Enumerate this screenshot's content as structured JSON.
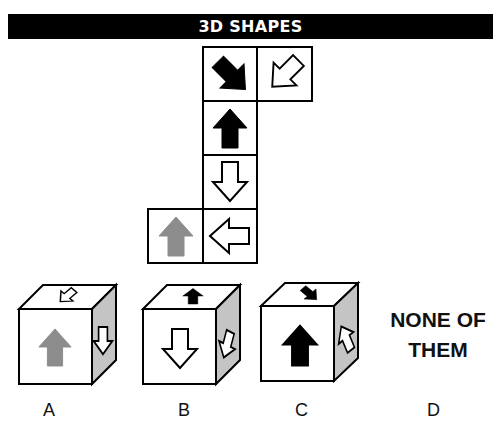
{
  "header": {
    "title": "3D SHAPES"
  },
  "net": {
    "cells": [
      {
        "position": "row1-col2",
        "arrow": "down-right",
        "fill": "black"
      },
      {
        "position": "row1-col3",
        "arrow": "down-left",
        "fill": "white"
      },
      {
        "position": "row2-col2",
        "arrow": "up",
        "fill": "black"
      },
      {
        "position": "row3-col2",
        "arrow": "down",
        "fill": "white"
      },
      {
        "position": "row4-col1",
        "arrow": "up",
        "fill": "gray"
      },
      {
        "position": "row4-col2",
        "arrow": "left",
        "fill": "white"
      }
    ]
  },
  "options": [
    {
      "label": "A",
      "front": "gray up arrow",
      "top": "white down-left arrow",
      "side": "white down arrow"
    },
    {
      "label": "B",
      "front": "white down arrow",
      "top": "black up arrow",
      "side": "white down-left arrow"
    },
    {
      "label": "C",
      "front": "black up arrow",
      "top": "black down-right arrow",
      "side": "white up-left arrow"
    },
    {
      "label": "D",
      "text_line1": "NONE OF",
      "text_line2": "THEM"
    }
  ],
  "colors": {
    "black": "#000000",
    "gray": "#8c8c8c",
    "side_face": "#c4c4c4",
    "white": "#ffffff"
  }
}
